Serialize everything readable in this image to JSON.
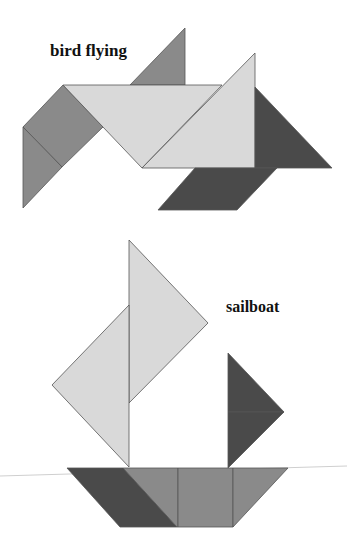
{
  "figures": [
    {
      "id": "bird",
      "title": "bird flying",
      "pieces": [
        {
          "name": "small-triangle-top",
          "shade": "medium",
          "points": "130,85 185,28 185,85"
        },
        {
          "name": "square-wing",
          "shade": "medium",
          "points": "63,85 103,127 62,167 23,127"
        },
        {
          "name": "small-triangle-wing",
          "shade": "medium",
          "points": "23,127 62,167 23,208"
        },
        {
          "name": "large-triangle-body",
          "shade": "light",
          "points": "63,85 222,85 142,168"
        },
        {
          "name": "large-triangle-neck",
          "shade": "light",
          "points": "255,53 255,168 142,168"
        },
        {
          "name": "medium-triangle-tail",
          "shade": "dark",
          "points": "255,87 332,168 255,168"
        },
        {
          "name": "parallelogram-feet",
          "shade": "dark",
          "points": "195,168 277,168 237,210 158,210"
        }
      ]
    },
    {
      "id": "sailboat",
      "title": "sailboat",
      "pieces": [
        {
          "name": "large-triangle-main-sail",
          "shade": "light",
          "points": "129,240 208,323 129,403"
        },
        {
          "name": "large-triangle-front-sail",
          "shade": "light",
          "points": "129,305 129,467 52,385"
        },
        {
          "name": "small-triangle-flag-top",
          "shade": "dark",
          "points": "228,353 284,412 228,412"
        },
        {
          "name": "small-triangle-flag-bottom",
          "shade": "dark",
          "points": "228,412 284,412 228,468"
        },
        {
          "name": "parallelogram-hull",
          "shade": "dark",
          "points": "67,468 123,468 177,527 120,527"
        },
        {
          "name": "medium-triangle-hull",
          "shade": "medium",
          "points": "123,468 178,468 178,527 177,527"
        },
        {
          "name": "square-hull",
          "shade": "medium",
          "points": "178,468 233,468 233,527 178,527"
        },
        {
          "name": "small-triangle-bow",
          "shade": "medium",
          "points": "233,468 288,468 233,527"
        }
      ]
    }
  ],
  "colors": {
    "light": "#d9d9d9",
    "medium": "#8a8a8a",
    "dark": "#4a4a4a",
    "stroke": "#555555",
    "guide_line": "#cfcfcf"
  },
  "guide_line": {
    "x1": 0,
    "y1": 476,
    "x2": 347,
    "y2": 466
  }
}
